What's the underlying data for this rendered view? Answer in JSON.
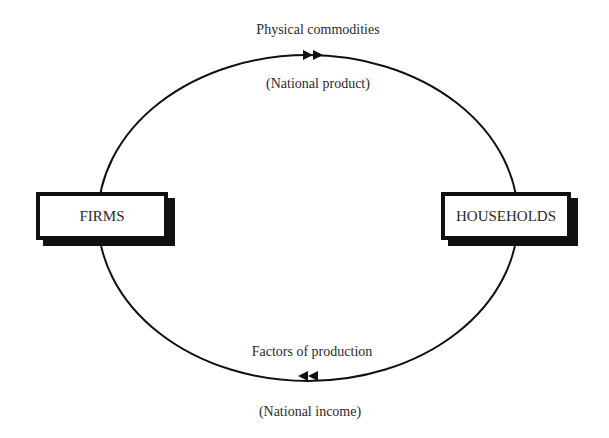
{
  "diagram": {
    "type": "circular-flow",
    "nodes": {
      "firms": {
        "label": "FIRMS"
      },
      "households": {
        "label": "HOUSEHOLDS"
      }
    },
    "top_flow": {
      "label": "Physical commodities",
      "sublabel": "(National product)",
      "direction": "firms-to-households"
    },
    "bottom_flow": {
      "label": "Factors of production",
      "sublabel": "(National income)",
      "direction": "households-to-firms"
    },
    "colors": {
      "line": "#111111",
      "background": "#ffffff",
      "text": "#2a2a2a"
    }
  }
}
